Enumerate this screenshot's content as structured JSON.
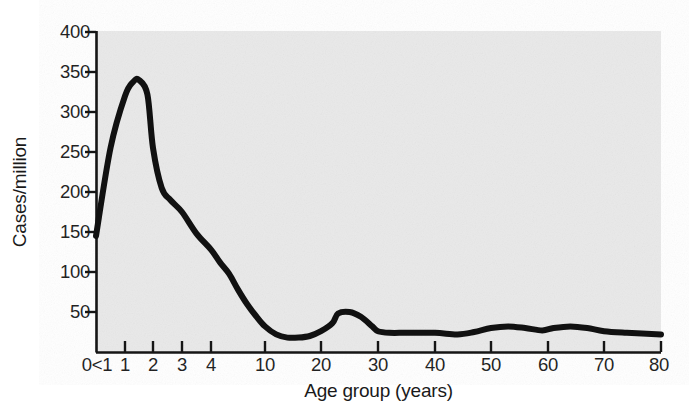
{
  "chart_data": {
    "type": "line",
    "title": "",
    "subtitle": "",
    "xlabel": "Age group (years)",
    "ylabel": "Cases/million",
    "grid": false,
    "legend": null,
    "legend_position": "none",
    "ylim": [
      0,
      400
    ],
    "ytick_values": [
      0,
      50,
      100,
      150,
      200,
      250,
      300,
      350,
      400
    ],
    "ytick_labels": [
      "",
      "50",
      "100",
      "150",
      "200",
      "250",
      "300",
      "350",
      "400"
    ],
    "xtick_labels": [
      "0<1",
      "1",
      "2",
      "3",
      "4",
      "10",
      "20",
      "30",
      "40",
      "50",
      "60",
      "70",
      "80"
    ],
    "xtick_values": [
      0,
      1,
      2,
      3,
      4,
      10,
      20,
      30,
      40,
      50,
      60,
      70,
      80
    ],
    "x_axis_scale": "non-linear (compressed for ages 0-10, linear 10-80)",
    "line_color": "#111111",
    "line_width_px": 6,
    "plot_background_color": "#e9e9e9",
    "series": [
      {
        "name": "Cases per million by age group",
        "x": [
          0,
          0.5,
          1.0,
          1.3,
          1.5,
          1.8,
          2.0,
          2.3,
          2.6,
          3.0,
          3.5,
          4.0,
          5.0,
          6.0,
          7.0,
          8.0,
          9.0,
          10.0,
          12.0,
          14.0,
          16.0,
          18.0,
          20.0,
          22.0,
          23.0,
          25.0,
          27.0,
          29.0,
          30.0,
          32.0,
          35.0,
          40.0,
          44.0,
          47.0,
          50.0,
          53.0,
          56.0,
          59.0,
          61.0,
          64.0,
          67.0,
          70.0,
          74.0,
          80.0
        ],
        "values": [
          145,
          255,
          320,
          338,
          340,
          322,
          255,
          205,
          190,
          175,
          148,
          128,
          112,
          98,
          78,
          60,
          45,
          32,
          22,
          18,
          18,
          20,
          26,
          36,
          48,
          50,
          44,
          32,
          26,
          24,
          24,
          24,
          22,
          25,
          30,
          32,
          30,
          27,
          30,
          32,
          30,
          26,
          24,
          22
        ]
      }
    ],
    "annotations": [
      {
        "text": "peak",
        "x": 1.5,
        "y": 340
      },
      {
        "text": "secondary bump",
        "x": 23,
        "y": 50
      },
      {
        "text": "trough",
        "x": 14,
        "y": 18
      }
    ]
  }
}
